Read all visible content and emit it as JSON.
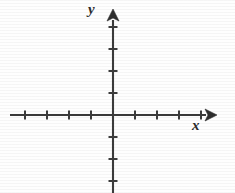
{
  "figure": {
    "type": "coordinate-plane",
    "background_color": "#fefefe",
    "line_color": "#3c3c3c",
    "width": 235,
    "height": 193
  },
  "labels": {
    "x_axis": "x",
    "y_axis": "y"
  },
  "chart_data": {
    "type": "scatter",
    "title": "",
    "subtitle": "",
    "xlabel": "x",
    "ylabel": "y",
    "x": [],
    "y": [],
    "series": [],
    "annotations": [],
    "legend": [],
    "legend_position": "none",
    "grid": false,
    "origin_px": [
      113,
      115
    ],
    "tick_spacing_px": 22,
    "xlim": [
      -5,
      5
    ],
    "ylim": [
      -4,
      5
    ],
    "x_ticks_negative_count": 4,
    "x_ticks_positive_count": 4,
    "y_ticks_negative_count": 3,
    "y_ticks_positive_count": 4,
    "x_tick_values": [
      -4,
      -3,
      -2,
      -1,
      1,
      2,
      3,
      4
    ],
    "y_tick_values": [
      -3,
      -2,
      -1,
      1,
      2,
      3,
      4
    ],
    "x_tick_labels": [],
    "y_tick_labels": [],
    "axis_arrows": [
      "x-positive",
      "y-positive"
    ]
  },
  "geometry": {
    "origin_x": 113,
    "origin_y": 115,
    "step": 22,
    "x_axis_start": 10,
    "x_axis_end": 206,
    "x_arrow_tip": 217,
    "y_axis_top": 20,
    "y_arrow_tip": 9,
    "y_axis_bottom": 193,
    "tick_half_x": 4.5,
    "tick_half_y": 4.5,
    "arrow_half_width": 6,
    "arrow_length": 12
  }
}
